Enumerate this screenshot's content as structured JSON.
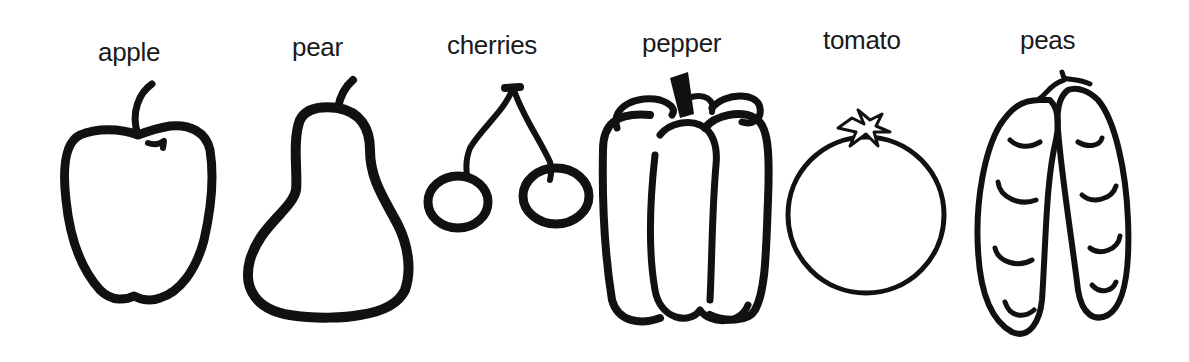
{
  "items": [
    {
      "name": "apple",
      "label": "apple",
      "icon": "apple-icon"
    },
    {
      "name": "pear",
      "label": "pear",
      "icon": "pear-icon"
    },
    {
      "name": "cherries",
      "label": "cherries",
      "icon": "cherries-icon"
    },
    {
      "name": "pepper",
      "label": "pepper",
      "icon": "pepper-icon"
    },
    {
      "name": "tomato",
      "label": "tomato",
      "icon": "tomato-icon"
    },
    {
      "name": "peas",
      "label": "peas",
      "icon": "peas-icon"
    }
  ],
  "colors": {
    "ink": "#111111",
    "background": "#ffffff"
  }
}
